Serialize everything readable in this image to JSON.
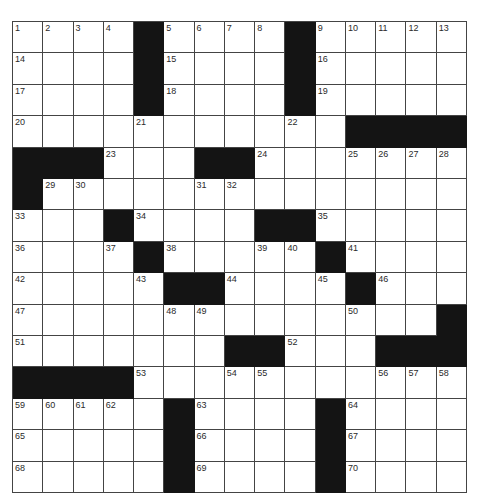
{
  "puzzle": {
    "rows": 15,
    "cols": 15,
    "colors": {
      "block": "#141414",
      "cell": "#ffffff",
      "line": "#444444",
      "number": "#2a2a2a"
    },
    "grid": [
      [
        "1",
        "2",
        "3",
        "4",
        "#",
        "5",
        "6",
        "7",
        "8",
        "#",
        "9",
        "10",
        "11",
        "12",
        "13"
      ],
      [
        "14",
        ".",
        ".",
        ".",
        "#",
        "15",
        ".",
        ".",
        ".",
        "#",
        "16",
        ".",
        ".",
        ".",
        "."
      ],
      [
        "17",
        ".",
        ".",
        ".",
        "#",
        "18",
        ".",
        ".",
        ".",
        "#",
        "19",
        ".",
        ".",
        ".",
        "."
      ],
      [
        "20",
        ".",
        ".",
        ".",
        "21",
        ".",
        ".",
        ".",
        ".",
        "22",
        ".",
        "#",
        "#",
        "#",
        "#"
      ],
      [
        "#",
        "#",
        "#",
        "23",
        ".",
        ".",
        "#",
        "#",
        "24",
        ".",
        ".",
        "25",
        "26",
        "27",
        "28"
      ],
      [
        "#",
        "29",
        "30",
        ".",
        ".",
        ".",
        "31",
        "32",
        ".",
        ".",
        ".",
        ".",
        ".",
        ".",
        "."
      ],
      [
        "33",
        ".",
        ".",
        "#",
        "34",
        ".",
        ".",
        ".",
        "#",
        "#",
        "35",
        ".",
        ".",
        ".",
        "."
      ],
      [
        "36",
        ".",
        ".",
        "37",
        "#",
        "38",
        ".",
        ".",
        "39",
        "40",
        "#",
        "41",
        ".",
        ".",
        "."
      ],
      [
        "42",
        ".",
        ".",
        ".",
        "43",
        "#",
        "#",
        "44",
        ".",
        ".",
        "45",
        "#",
        "46",
        ".",
        "."
      ],
      [
        "47",
        ".",
        ".",
        ".",
        ".",
        "48",
        "49",
        ".",
        ".",
        ".",
        ".",
        "50",
        ".",
        ".",
        "#"
      ],
      [
        "51",
        ".",
        ".",
        ".",
        ".",
        ".",
        ".",
        "#",
        "#",
        "52",
        ".",
        ".",
        "#",
        "#",
        "#"
      ],
      [
        "#",
        "#",
        "#",
        "#",
        "53",
        ".",
        ".",
        "54",
        "55",
        ".",
        ".",
        ".",
        "56",
        "57",
        "58"
      ],
      [
        "59",
        "60",
        "61",
        "62",
        ".",
        "#",
        "63",
        ".",
        ".",
        ".",
        "#",
        "64",
        ".",
        ".",
        "."
      ],
      [
        "65",
        ".",
        ".",
        ".",
        ".",
        "#",
        "66",
        ".",
        ".",
        ".",
        "#",
        "67",
        ".",
        ".",
        "."
      ],
      [
        "68",
        ".",
        ".",
        ".",
        ".",
        "#",
        "69",
        ".",
        ".",
        ".",
        "#",
        "70",
        ".",
        ".",
        "."
      ]
    ]
  }
}
